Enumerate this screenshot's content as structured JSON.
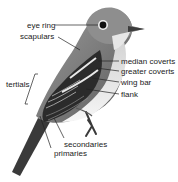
{
  "diagram": {
    "labels": {
      "eye_ring": "eye ring",
      "scapulars": "scapulars",
      "median_coverts": "median coverts",
      "greater_coverts": "greater coverts",
      "wing_bar": "wing bar",
      "flank": "flank",
      "tertials": "tertials",
      "secondaries": "secondaries",
      "primaries": "primaries"
    },
    "colors": {
      "head": "#8f8f8f",
      "back": "#7a7a7a",
      "wing": "#2a2a2a",
      "wing_bar": "#e8e8e8",
      "breast": "#d9d9d9",
      "belly": "#f4f4f4",
      "leader_line": "#222222"
    }
  }
}
